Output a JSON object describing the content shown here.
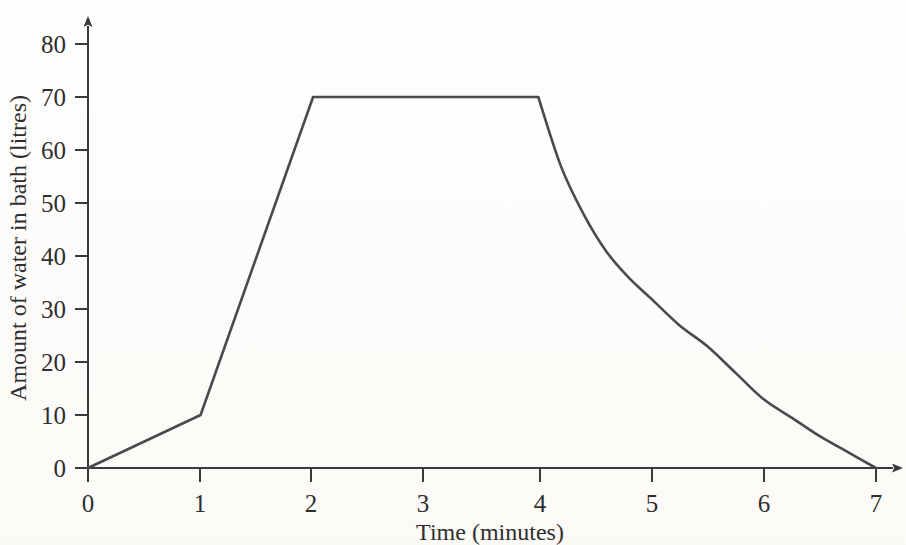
{
  "chart_data": {
    "type": "line",
    "title": "",
    "subtitle": "",
    "xlabel": "Time (minutes)",
    "ylabel": "Amount of water in bath (litres)",
    "xlim": [
      0,
      7
    ],
    "ylim": [
      0,
      80
    ],
    "xticks": [
      "0",
      "1",
      "2",
      "3",
      "4",
      "5",
      "6",
      "7"
    ],
    "yticks": [
      "0",
      "10",
      "20",
      "30",
      "40",
      "50",
      "60",
      "70",
      "80"
    ],
    "grid": false,
    "legend": "none",
    "line_color": "#4a4a4a",
    "background_color": "#fdfdfb",
    "axis_color": "#3a3a3a",
    "series": [
      {
        "name": "Amount of water in bath",
        "x": [
          0,
          1,
          2,
          3,
          4,
          4.2,
          4.4,
          4.6,
          4.8,
          5,
          5.25,
          5.5,
          5.75,
          6,
          6.25,
          6.5,
          6.75,
          7
        ],
        "values": [
          0,
          10,
          70,
          70,
          70,
          57,
          48,
          41,
          36,
          32,
          27,
          23,
          18,
          13,
          9.5,
          6,
          3,
          0
        ]
      }
    ],
    "annotations": [
      {
        "label": "fill slowly",
        "from_x": 0,
        "to_x": 1,
        "from_y": 0,
        "to_y": 10
      },
      {
        "label": "fill fast",
        "from_x": 1,
        "to_x": 2,
        "from_y": 10,
        "to_y": 70
      },
      {
        "label": "constant level",
        "from_x": 2,
        "to_x": 4,
        "from_y": 70,
        "to_y": 70
      },
      {
        "label": "drain",
        "from_x": 4,
        "to_x": 7,
        "from_y": 70,
        "to_y": 0
      }
    ]
  },
  "axis": {
    "x_title": "Time (minutes)",
    "y_title": "Amount of water in bath (litres)"
  }
}
